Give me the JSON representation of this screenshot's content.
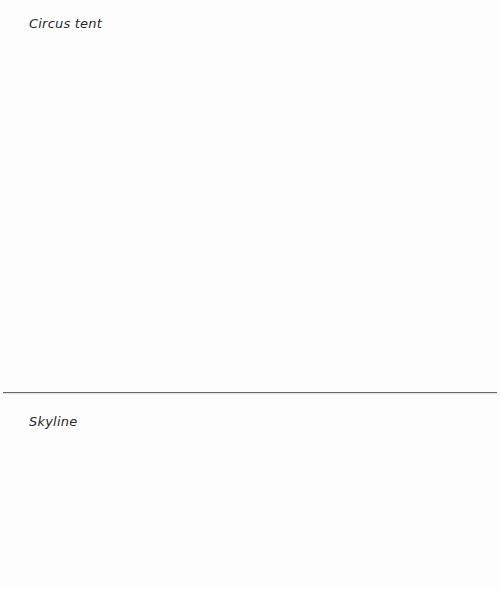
{
  "panels": [
    {
      "label": "Circus tent"
    },
    {
      "label": "Skyline"
    }
  ],
  "colors": {
    "background": "#fdfdfd",
    "divider": "#6a6a6a",
    "text": "#2a2a2a"
  }
}
